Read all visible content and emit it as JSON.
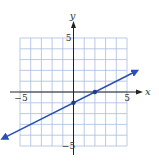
{
  "chart_data": {
    "type": "line",
    "title": "",
    "xlabel": "x",
    "ylabel": "y",
    "xlim": [
      -5,
      5
    ],
    "ylim": [
      -5,
      5
    ],
    "grid": true,
    "x_ticks_labeled": [
      -5,
      5
    ],
    "y_ticks_labeled": [
      5,
      -5
    ],
    "tick_labels": {
      "x_neg": "−5",
      "x_pos": "5",
      "y_pos": "5",
      "y_neg": "−5"
    },
    "series": [
      {
        "name": "line",
        "equation": "y = (1/2)x − 1",
        "slope": 0.5,
        "intercept": -1,
        "x": [
          -6.5,
          5.8
        ],
        "y": [
          -4.25,
          1.9
        ],
        "arrows_both_ends": true,
        "marked_points": [
          {
            "x": 0,
            "y": -1
          },
          {
            "x": 2,
            "y": 0
          }
        ],
        "color": "#2b4fb3"
      }
    ]
  },
  "colors": {
    "grid": "#a9bce0",
    "axis": "#222222",
    "line": "#2b4fb3",
    "point": "#1f3b8c"
  }
}
